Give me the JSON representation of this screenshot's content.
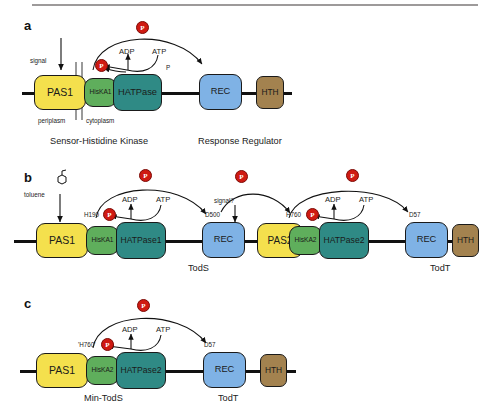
{
  "figure": {
    "type": "pathway-diagram",
    "colors": {
      "pas": "#f4e04d",
      "hiska": "#5fae5c",
      "hatpase": "#2f8a85",
      "rec": "#7fb2e5",
      "hth": "#a3824f",
      "phospho": "#cf1a12",
      "line": "#111111",
      "membrane": "#9a9a9a"
    },
    "phospho_label": "P"
  },
  "panels": [
    {
      "id": "a",
      "label": "a",
      "domains": [
        {
          "name": "PAS1",
          "color": "pas"
        },
        {
          "name": "HisKA1",
          "color": "hiska"
        },
        {
          "name": "HATPase",
          "color": "hatpase"
        },
        {
          "name": "REC",
          "color": "rec"
        },
        {
          "name": "HTH",
          "color": "hth"
        }
      ],
      "annotations": {
        "signal": "signal",
        "adp": "ADP",
        "atp": "ATP",
        "pi": "P",
        "periplasm": "periplasm",
        "cytoplasm": "cytoplasm"
      },
      "captions": [
        {
          "text": "Sensor-Histidine Kinase"
        },
        {
          "text": "Response Regulator"
        }
      ]
    },
    {
      "id": "b",
      "label": "b",
      "domains": [
        {
          "name": "PAS1",
          "color": "pas"
        },
        {
          "name": "HisKA1",
          "color": "hiska"
        },
        {
          "name": "HATPase1",
          "color": "hatpase"
        },
        {
          "name": "REC",
          "color": "rec"
        },
        {
          "name": "PAS2",
          "color": "pas"
        },
        {
          "name": "HisKA2",
          "color": "hiska"
        },
        {
          "name": "HATPase2",
          "color": "hatpase"
        },
        {
          "name": "REC",
          "color": "rec"
        },
        {
          "name": "HTH",
          "color": "hth"
        }
      ],
      "annotations": {
        "ligand": "toluene",
        "adp1": "ADP",
        "atp1": "ATP",
        "his1": "H190",
        "asp1": "D500",
        "signal2": "signal?",
        "adp2": "ADP",
        "atp2": "ATP",
        "his2": "H760",
        "asp2": "D57"
      },
      "captions": [
        {
          "text": "TodS"
        },
        {
          "text": "TodT"
        }
      ]
    },
    {
      "id": "c",
      "label": "c",
      "domains": [
        {
          "name": "PAS1",
          "color": "pas"
        },
        {
          "name": "HisKA2",
          "color": "hiska"
        },
        {
          "name": "HATPase2",
          "color": "hatpase"
        },
        {
          "name": "REC",
          "color": "rec"
        },
        {
          "name": "HTH",
          "color": "hth"
        }
      ],
      "annotations": {
        "adp": "ADP",
        "atp": "ATP",
        "his": "'H760'",
        "asp": "D57"
      },
      "captions": [
        {
          "text": "Min-TodS"
        },
        {
          "text": "TodT"
        }
      ]
    }
  ]
}
